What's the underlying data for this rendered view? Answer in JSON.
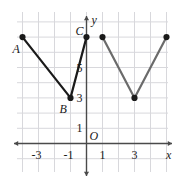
{
  "figure": {
    "width": 181,
    "height": 184,
    "background_color": "#ffffff",
    "grid_color": "#d8d8dc",
    "axis_color": "#4a4a4a",
    "curve_color_left": "#1a1a1a",
    "curve_color_right": "#6b6b6b",
    "point_color": "#1a1a1a"
  },
  "axes": {
    "x_axis_label": "x",
    "y_axis_label": "y",
    "origin_label": "O",
    "x_ticks": [
      {
        "label": "-3",
        "value": -3
      },
      {
        "label": "-1",
        "value": -1
      },
      {
        "label": "1",
        "value": 1
      },
      {
        "label": "3",
        "value": 3
      }
    ],
    "y_ticks": [
      {
        "label": "5",
        "value": 5
      },
      {
        "label": "3",
        "value": 3
      },
      {
        "label": "1",
        "value": 1
      }
    ],
    "xlim": [
      -5,
      6
    ],
    "ylim": [
      -2,
      8
    ],
    "grid": true
  },
  "point_labels": [
    {
      "name": "A",
      "label": "A",
      "x": -4,
      "y": 7
    },
    {
      "name": "B",
      "label": "B",
      "x": -1,
      "y": 3
    },
    {
      "name": "C",
      "label": "C",
      "x": 0,
      "y": 7
    }
  ],
  "chart_data": {
    "type": "line",
    "title": "",
    "xlabel": "x",
    "ylabel": "y",
    "xlim": [
      -5,
      6
    ],
    "ylim": [
      -2,
      8
    ],
    "grid": true,
    "legend": "none",
    "series": [
      {
        "name": "left-segment",
        "color": "#1a1a1a",
        "points": [
          {
            "x": -4,
            "y": 7,
            "label": "A"
          },
          {
            "x": -1,
            "y": 3,
            "label": "B"
          },
          {
            "x": 0,
            "y": 7,
            "label": "C"
          }
        ]
      },
      {
        "name": "right-segment",
        "color": "#6b6b6b",
        "points": [
          {
            "x": 1,
            "y": 7,
            "label": ""
          },
          {
            "x": 3,
            "y": 3,
            "label": ""
          },
          {
            "x": 5,
            "y": 7,
            "label": ""
          }
        ]
      }
    ],
    "markers": [
      {
        "x": -4,
        "y": 7
      },
      {
        "x": -1,
        "y": 3
      },
      {
        "x": 0,
        "y": 7
      },
      {
        "x": 1,
        "y": 7
      },
      {
        "x": 3,
        "y": 3
      },
      {
        "x": 5,
        "y": 7
      }
    ]
  }
}
